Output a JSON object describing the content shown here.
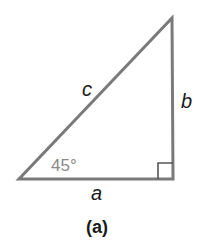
{
  "diagram": {
    "labels": {
      "hypotenuse": "c",
      "vertical_leg": "b",
      "horizontal_leg": "a",
      "angle": "45°",
      "caption": "(a)"
    },
    "colors": {
      "line": "#7a7a7a",
      "angle_text": "#8a8a8a",
      "text": "#1a1a1a"
    }
  }
}
